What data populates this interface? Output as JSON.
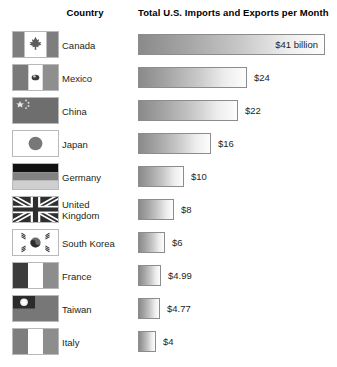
{
  "header": {
    "country_label": "Country",
    "value_label": "Total U.S. Imports and Exports per Month"
  },
  "chart_data": {
    "type": "bar",
    "title": "Total U.S. Imports and Exports per Month",
    "xlabel": "",
    "ylabel": "Country",
    "orientation": "horizontal",
    "grid": false,
    "legend": false,
    "unit": "billion U.S. dollars per month",
    "xlim": [
      0,
      41
    ],
    "categories": [
      "Canada",
      "Mexico",
      "China",
      "Japan",
      "Germany",
      "United Kingdom",
      "South Korea",
      "France",
      "Taiwan",
      "Italy"
    ],
    "values": [
      41,
      24,
      22,
      16,
      10,
      8,
      6,
      4.99,
      4.77,
      4
    ],
    "data_labels": [
      "$41 billion",
      "$24",
      "$22",
      "$16",
      "$10",
      "$8",
      "$6",
      "$4.99",
      "$4.77",
      "$4"
    ],
    "label_placement": [
      "inside",
      "outside",
      "outside",
      "outside",
      "outside",
      "outside",
      "outside",
      "outside",
      "outside",
      "outside"
    ]
  },
  "rows": [
    {
      "country": "Canada",
      "flag": "flag-canada",
      "value_label": "$41 billion",
      "value": 41
    },
    {
      "country": "Mexico",
      "flag": "flag-mexico",
      "value_label": "$24",
      "value": 24
    },
    {
      "country": "China",
      "flag": "flag-china",
      "value_label": "$22",
      "value": 22
    },
    {
      "country": "Japan",
      "flag": "flag-japan",
      "value_label": "$16",
      "value": 16
    },
    {
      "country": "Germany",
      "flag": "flag-germany",
      "value_label": "$10",
      "value": 10
    },
    {
      "country": "United Kingdom",
      "flag": "flag-united-kingdom",
      "value_label": "$8",
      "value": 8
    },
    {
      "country": "South Korea",
      "flag": "flag-south-korea",
      "value_label": "$6",
      "value": 6
    },
    {
      "country": "France",
      "flag": "flag-france",
      "value_label": "$4.99",
      "value": 4.99
    },
    {
      "country": "Taiwan",
      "flag": "flag-taiwan",
      "value_label": "$4.77",
      "value": 4.77
    },
    {
      "country": "Italy",
      "flag": "flag-italy",
      "value_label": "$4",
      "value": 4
    }
  ],
  "colors": {
    "bar_dark": "#8a8a8a",
    "bar_light": "#fdfdfd",
    "bar_border": "#8c8c8c",
    "text": "#231f20",
    "background": "#ffffff"
  }
}
